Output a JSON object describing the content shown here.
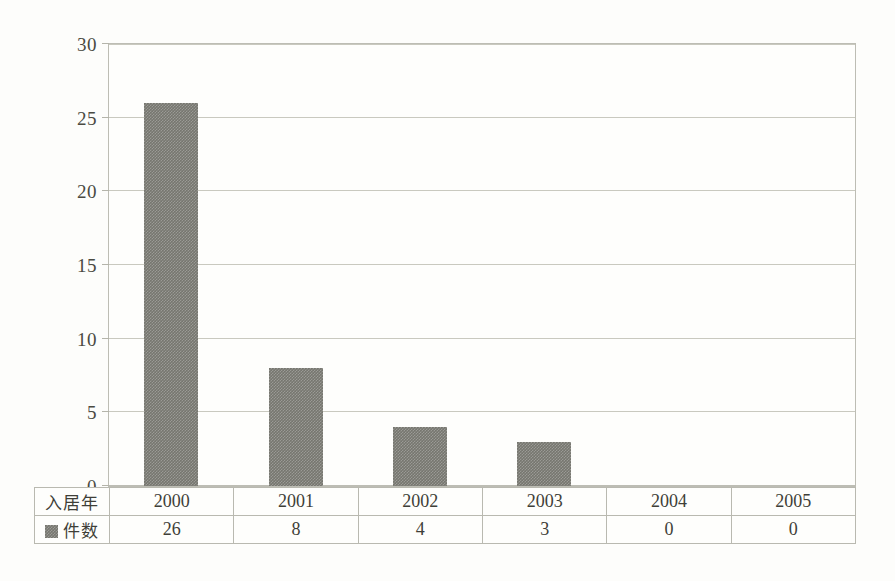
{
  "chart_data": {
    "type": "bar",
    "title": "",
    "xlabel": "",
    "ylabel": "",
    "categories": [
      "2000",
      "2001",
      "2002",
      "2003",
      "2004",
      "2005"
    ],
    "values": [
      26,
      8,
      4,
      3,
      0,
      0
    ],
    "series": [
      {
        "name": "件数",
        "values": [
          26,
          8,
          4,
          3,
          0,
          0
        ]
      }
    ],
    "ylim": [
      0,
      30
    ],
    "yticks": [
      0,
      5,
      10,
      15,
      20,
      25,
      30
    ],
    "ytick_labels": [
      "0",
      "5",
      "10",
      "15",
      "20",
      "25",
      "30"
    ],
    "grid": true,
    "legend_position": "table-row-header",
    "bar_color": "#76766f",
    "gridline_color": "#c9c9bf",
    "frame_color": "#bdbdb4"
  },
  "table": {
    "row_headers": [
      "入居年",
      "件数"
    ],
    "legend_swatch_color": "#76766f",
    "columns": [
      "2000",
      "2001",
      "2002",
      "2003",
      "2004",
      "2005"
    ],
    "counts": [
      "26",
      "8",
      "4",
      "3",
      "0",
      "0"
    ]
  }
}
